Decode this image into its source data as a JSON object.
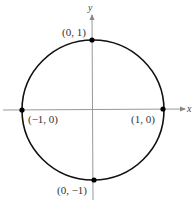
{
  "diagram": {
    "axes": {
      "x_label": "x",
      "y_label": "y"
    },
    "colors": {
      "circle": "#111111",
      "axis": "#888888",
      "point": "#000000",
      "text": "#333333"
    },
    "points": [
      {
        "label": "(0, 1)"
      },
      {
        "label": "(−1, 0)"
      },
      {
        "label": "(1, 0)"
      },
      {
        "label": "(0, −1)"
      }
    ]
  }
}
